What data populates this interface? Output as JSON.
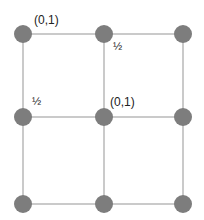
{
  "diagram": {
    "type": "grid-graph",
    "rows": 3,
    "cols": 3,
    "node_color": "#7d7d7d",
    "edge_color": "#b8b8b8",
    "nodes": [
      {
        "id": "n00",
        "x": 23,
        "y": 34
      },
      {
        "id": "n01",
        "x": 104,
        "y": 34
      },
      {
        "id": "n02",
        "x": 183,
        "y": 34
      },
      {
        "id": "n10",
        "x": 23,
        "y": 117
      },
      {
        "id": "n11",
        "x": 104,
        "y": 117
      },
      {
        "id": "n12",
        "x": 183,
        "y": 117
      },
      {
        "id": "n20",
        "x": 23,
        "y": 204
      },
      {
        "id": "n21",
        "x": 104,
        "y": 204
      },
      {
        "id": "n22",
        "x": 183,
        "y": 204
      }
    ],
    "labels": {
      "top_left": "(0,1)",
      "top_middle": "½",
      "middle_left": "½",
      "center": "(0,1)"
    }
  }
}
